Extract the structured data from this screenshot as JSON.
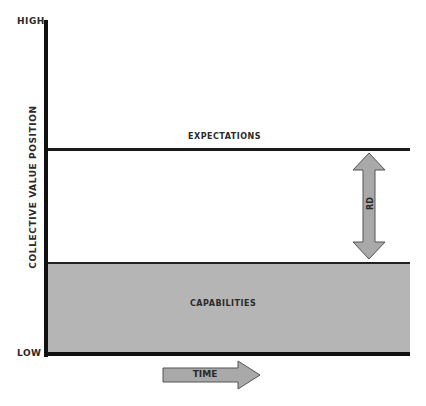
{
  "axes": {
    "y_label": "COLLECTIVE VALUE POSITION",
    "y_high": "HIGH",
    "y_low": "LOW",
    "x_label": "TIME"
  },
  "levels": {
    "expectations": "EXPECTATIONS",
    "capabilities": "CAPABILITIES"
  },
  "gap": {
    "label": "RD"
  },
  "colors": {
    "axis": "#111111",
    "capabilities_fill": "#b5b5b5",
    "arrow_fill": "#a9a9a9",
    "arrow_stroke": "#555555"
  }
}
